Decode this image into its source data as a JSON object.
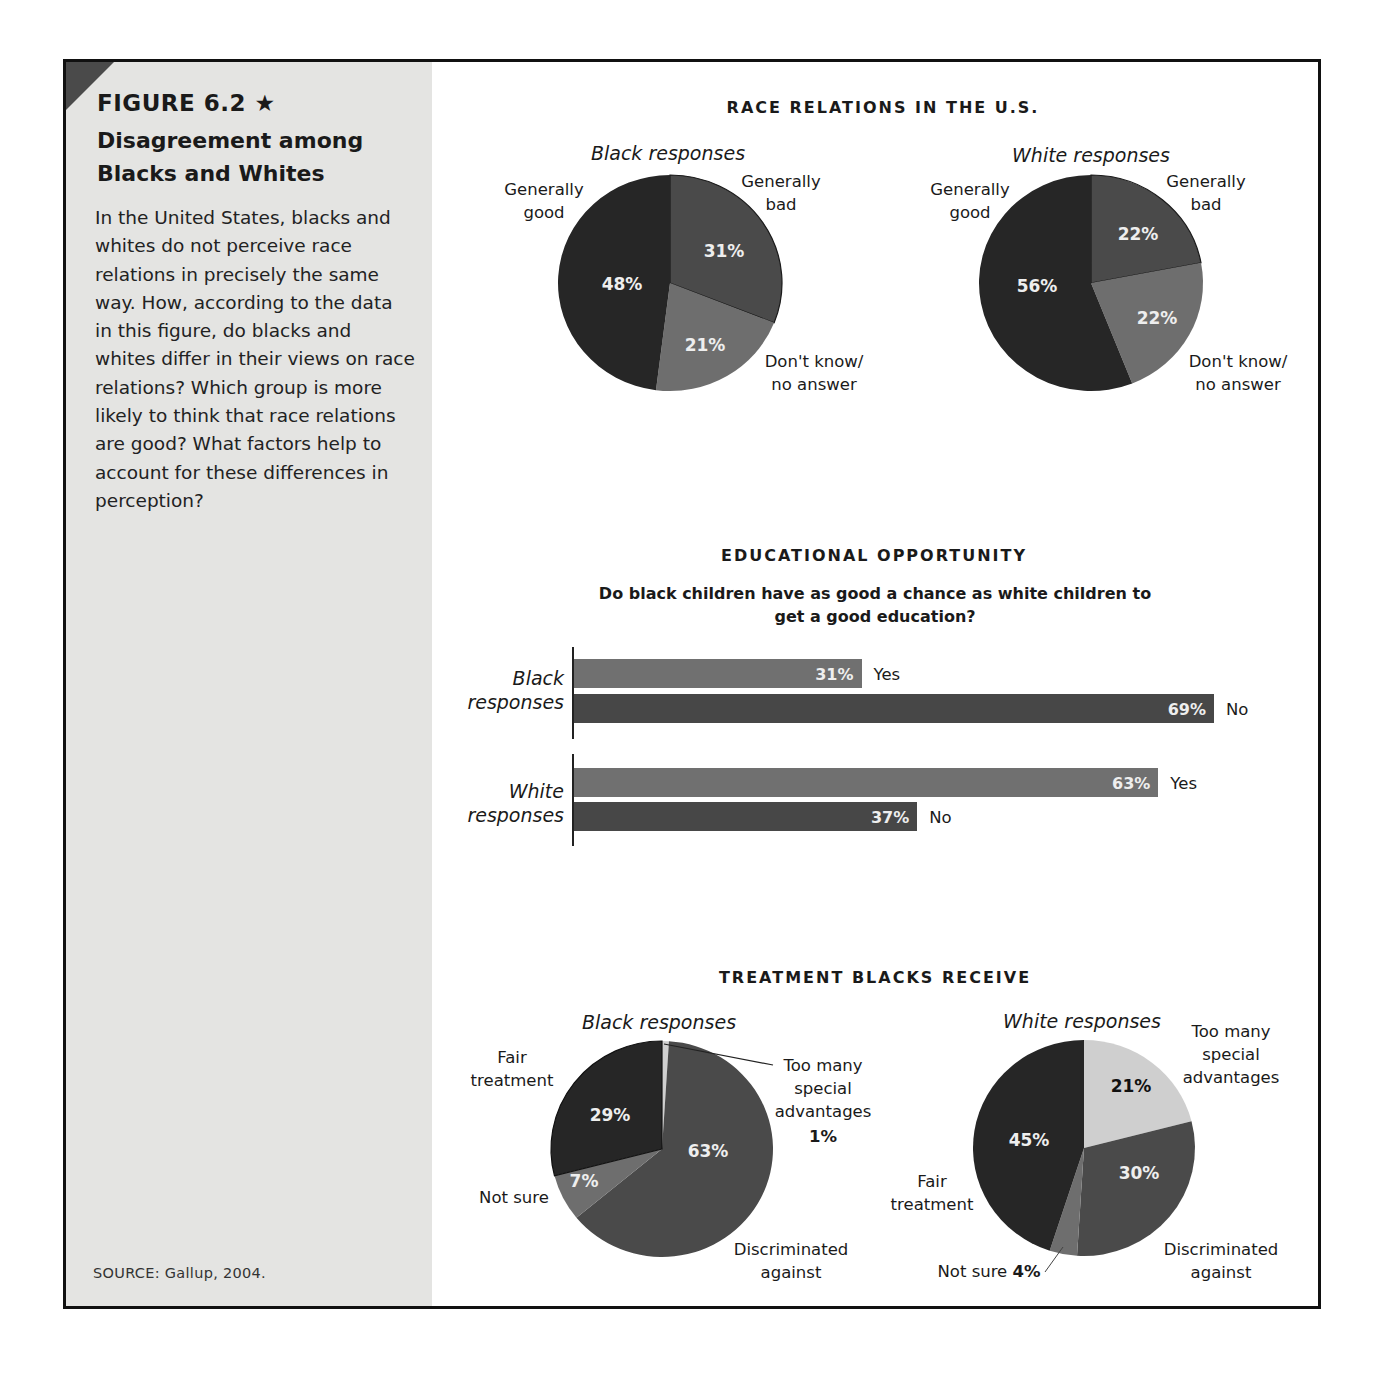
{
  "figure": {
    "label": "FIGURE 6.2",
    "star_icon": "★",
    "title": "Disagreement among Blacks and Whites",
    "body": "In the United States, blacks and whites do not perceive race relations in precisely the same way. How, according to the data in this figure, do blacks and whites differ in their views on race relations? Which group is more likely to think that race relations are good? What factors help to account for these differences in perception?",
    "source": "SOURCE: Gallup, 2004."
  },
  "colors": {
    "very_dark": "#262626",
    "dark": "#4a4a4a",
    "medium": "#6e6e6e",
    "light": "#cfcfcf",
    "bar_yes": "#707070",
    "bar_no": "#474747",
    "sidebar_bg": "#e4e4e2"
  },
  "race_relations": {
    "title": "RACE RELATIONS IN THE U.S.",
    "black": {
      "title": "Black responses",
      "labels": {
        "good": "Generally\ngood",
        "bad": "Generally\nbad",
        "dk": "Don't know/\nno answer"
      },
      "values": {
        "good": "48%",
        "bad": "31%",
        "dk": "21%"
      }
    },
    "white": {
      "title": "White responses",
      "labels": {
        "good": "Generally\ngood",
        "bad": "Generally\nbad",
        "dk": "Don't know/\nno answer"
      },
      "values": {
        "good": "56%",
        "bad": "22%",
        "dk": "22%"
      }
    }
  },
  "education": {
    "title": "EDUCATIONAL OPPORTUNITY",
    "question": "Do black children have as good a chance as white children to get a good education?",
    "black": {
      "label": "Black\nresponses",
      "yes": "31%",
      "no": "69%",
      "yes_label": "Yes",
      "no_label": "No"
    },
    "white": {
      "label": "White\nresponses",
      "yes": "63%",
      "no": "37%",
      "yes_label": "Yes",
      "no_label": "No"
    }
  },
  "treatment": {
    "title": "TREATMENT BLACKS RECEIVE",
    "black": {
      "title": "Black responses",
      "labels": {
        "fair": "Fair\ntreatment",
        "too_many": "Too many\nspecial\nadvantages",
        "not_sure": "Not sure",
        "discriminated": "Discriminated\nagainst"
      },
      "values": {
        "fair": "29%",
        "too_many": "1%",
        "not_sure": "7%",
        "discriminated": "63%"
      }
    },
    "white": {
      "title": "White responses",
      "labels": {
        "fair": "Fair\ntreatment",
        "too_many": "Too many\nspecial\nadvantages",
        "not_sure": "Not sure",
        "discriminated": "Discriminated\nagainst"
      },
      "values": {
        "fair": "45%",
        "too_many": "21%",
        "not_sure": "4%",
        "discriminated": "30%"
      }
    }
  },
  "chart_data": [
    {
      "type": "pie",
      "title": "RACE RELATIONS IN THE U.S. — Black responses",
      "categories": [
        "Generally good",
        "Generally bad",
        "Don't know/no answer"
      ],
      "values": [
        48,
        31,
        21
      ]
    },
    {
      "type": "pie",
      "title": "RACE RELATIONS IN THE U.S. — White responses",
      "categories": [
        "Generally good",
        "Generally bad",
        "Don't know/no answer"
      ],
      "values": [
        56,
        22,
        22
      ]
    },
    {
      "type": "bar",
      "orientation": "horizontal",
      "title": "EDUCATIONAL OPPORTUNITY",
      "subtitle": "Do black children have as good a chance as white children to get a good education?",
      "categories": [
        "Black responses",
        "White responses"
      ],
      "series": [
        {
          "name": "Yes",
          "values": [
            31,
            63
          ]
        },
        {
          "name": "No",
          "values": [
            69,
            37
          ]
        }
      ],
      "xlim": [
        0,
        100
      ]
    },
    {
      "type": "pie",
      "title": "TREATMENT BLACKS RECEIVE — Black responses",
      "categories": [
        "Too many special advantages",
        "Discriminated against",
        "Not sure",
        "Fair treatment"
      ],
      "values": [
        1,
        63,
        7,
        29
      ]
    },
    {
      "type": "pie",
      "title": "TREATMENT BLACKS RECEIVE — White responses",
      "categories": [
        "Too many special advantages",
        "Discriminated against",
        "Not sure",
        "Fair treatment"
      ],
      "values": [
        21,
        30,
        4,
        45
      ]
    }
  ]
}
